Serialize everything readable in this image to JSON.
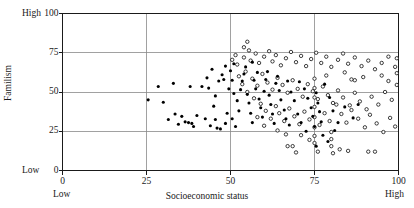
{
  "chart_data": {
    "type": "scatter",
    "title": "",
    "xlabel": "Socioeconomic status",
    "ylabel": "Familism",
    "xlim": [
      0,
      100
    ],
    "ylim": [
      0,
      100
    ],
    "xticks": [
      0,
      25,
      50,
      75,
      100
    ],
    "yticks": [
      0,
      25,
      50,
      75,
      100
    ],
    "xticklabels": [
      "0",
      "25",
      "50",
      "75",
      "100"
    ],
    "yticklabels": [
      "0",
      "25",
      "50",
      "75",
      "100"
    ],
    "grid": true,
    "grid_color": "#8a8a8a",
    "frame": true,
    "frame_color": "#1a1a1a",
    "axis_end_labels": {
      "x_low": "Low",
      "x_high": "High",
      "y_low": "Low",
      "y_high": "High"
    },
    "legend_position": "none",
    "series": [
      {
        "name": "filled",
        "marker": "filled-circle",
        "color": "#000000",
        "marker_size": 3.1,
        "points": [
          [
            25.5,
            45.0
          ],
          [
            28.5,
            53.5
          ],
          [
            33.0,
            55.5
          ],
          [
            38.0,
            53.5
          ],
          [
            41.5,
            53.5
          ],
          [
            43.5,
            52.5
          ],
          [
            45.5,
            47.5
          ],
          [
            45.0,
            41.0
          ],
          [
            46.5,
            57.0
          ],
          [
            47.5,
            61.0
          ],
          [
            48.5,
            66.5
          ],
          [
            48.0,
            58.0
          ],
          [
            49.5,
            52.0
          ],
          [
            50.0,
            63.5
          ],
          [
            50.5,
            57.5
          ],
          [
            51.0,
            49.0
          ],
          [
            33.5,
            36.0
          ],
          [
            36.5,
            31.0
          ],
          [
            37.5,
            30.5
          ],
          [
            38.5,
            30.0
          ],
          [
            40.0,
            35.0
          ],
          [
            42.5,
            33.0
          ],
          [
            44.0,
            28.5
          ],
          [
            45.5,
            32.5
          ],
          [
            46.0,
            27.0
          ],
          [
            47.0,
            26.5
          ],
          [
            48.5,
            30.0
          ],
          [
            49.0,
            36.5
          ],
          [
            50.5,
            33.0
          ],
          [
            51.5,
            28.0
          ],
          [
            52.0,
            44.5
          ],
          [
            52.5,
            38.0
          ],
          [
            53.0,
            51.5
          ],
          [
            53.5,
            57.0
          ],
          [
            54.0,
            61.5
          ],
          [
            54.5,
            66.0
          ],
          [
            55.0,
            48.5
          ],
          [
            55.5,
            43.0
          ],
          [
            56.0,
            36.5
          ],
          [
            56.5,
            30.5
          ],
          [
            57.0,
            57.5
          ],
          [
            57.5,
            52.0
          ],
          [
            58.0,
            62.5
          ],
          [
            58.5,
            45.5
          ],
          [
            59.0,
            40.0
          ],
          [
            59.5,
            34.0
          ],
          [
            60.0,
            50.5
          ],
          [
            60.5,
            58.0
          ],
          [
            61.0,
            63.0
          ],
          [
            61.5,
            48.0
          ],
          [
            62.0,
            42.0
          ],
          [
            62.5,
            36.0
          ],
          [
            63.0,
            30.0
          ],
          [
            63.5,
            55.5
          ],
          [
            64.0,
            60.0
          ],
          [
            64.5,
            51.0
          ],
          [
            65.0,
            45.0
          ],
          [
            66.0,
            38.5
          ],
          [
            66.5,
            33.0
          ],
          [
            67.0,
            57.0
          ],
          [
            68.0,
            50.0
          ],
          [
            69.0,
            44.5
          ],
          [
            70.0,
            36.0
          ],
          [
            71.0,
            30.5
          ],
          [
            72.0,
            52.0
          ],
          [
            73.0,
            46.0
          ],
          [
            74.0,
            40.0
          ],
          [
            74.5,
            34.5
          ],
          [
            75.0,
            28.0
          ],
          [
            75.5,
            49.5
          ],
          [
            76.0,
            43.0
          ],
          [
            76.5,
            37.5
          ],
          [
            77.0,
            31.0
          ],
          [
            78.0,
            55.0
          ],
          [
            79.5,
            46.5
          ],
          [
            80.5,
            38.0
          ],
          [
            82.0,
            30.5
          ],
          [
            84.0,
            40.5
          ],
          [
            86.5,
            33.5
          ],
          [
            88.0,
            42.0
          ],
          [
            30.0,
            43.5
          ],
          [
            31.5,
            32.5
          ],
          [
            34.5,
            29.5
          ],
          [
            35.5,
            34.5
          ],
          [
            39.0,
            28.0
          ],
          [
            43.0,
            59.0
          ],
          [
            44.5,
            64.5
          ],
          [
            51.0,
            68.0
          ],
          [
            56.5,
            69.0
          ],
          [
            67.5,
            29.0
          ],
          [
            70.5,
            56.5
          ],
          [
            81.0,
            25.5
          ],
          [
            77.5,
            22.5
          ],
          [
            79.0,
            18.5
          ],
          [
            75.5,
            15.5
          ],
          [
            72.5,
            25.0
          ]
        ]
      },
      {
        "name": "open",
        "marker": "open-circle",
        "color": "#000000",
        "marker_size": 3.4,
        "points": [
          [
            50.5,
            70.5
          ],
          [
            51.5,
            73.5
          ],
          [
            52.0,
            67.5
          ],
          [
            54.0,
            72.0
          ],
          [
            55.5,
            76.5
          ],
          [
            56.0,
            70.0
          ],
          [
            57.5,
            74.5
          ],
          [
            58.5,
            68.5
          ],
          [
            60.0,
            72.5
          ],
          [
            61.5,
            76.0
          ],
          [
            62.5,
            69.5
          ],
          [
            63.5,
            73.5
          ],
          [
            65.0,
            67.0
          ],
          [
            66.5,
            71.5
          ],
          [
            68.0,
            75.5
          ],
          [
            69.5,
            69.0
          ],
          [
            71.0,
            73.0
          ],
          [
            72.5,
            66.5
          ],
          [
            74.0,
            71.0
          ],
          [
            75.5,
            75.0
          ],
          [
            77.0,
            68.5
          ],
          [
            78.5,
            72.5
          ],
          [
            80.0,
            66.0
          ],
          [
            82.0,
            70.5
          ],
          [
            83.5,
            74.5
          ],
          [
            85.0,
            68.0
          ],
          [
            87.0,
            72.0
          ],
          [
            89.0,
            66.5
          ],
          [
            91.0,
            70.0
          ],
          [
            93.0,
            64.5
          ],
          [
            95.0,
            68.5
          ],
          [
            97.0,
            72.5
          ],
          [
            99.0,
            66.0
          ],
          [
            54.5,
            63.0
          ],
          [
            56.5,
            58.5
          ],
          [
            58.0,
            54.0
          ],
          [
            59.5,
            61.5
          ],
          [
            61.0,
            56.0
          ],
          [
            62.5,
            51.5
          ],
          [
            64.0,
            59.0
          ],
          [
            65.5,
            54.5
          ],
          [
            67.0,
            49.5
          ],
          [
            68.5,
            57.5
          ],
          [
            70.0,
            52.0
          ],
          [
            71.5,
            47.0
          ],
          [
            73.0,
            55.0
          ],
          [
            74.5,
            50.5
          ],
          [
            76.0,
            45.5
          ],
          [
            77.5,
            53.5
          ],
          [
            79.0,
            48.0
          ],
          [
            80.5,
            43.0
          ],
          [
            82.0,
            51.0
          ],
          [
            83.5,
            46.5
          ],
          [
            85.5,
            41.5
          ],
          [
            87.0,
            49.5
          ],
          [
            88.5,
            44.0
          ],
          [
            90.5,
            39.0
          ],
          [
            92.0,
            47.0
          ],
          [
            94.0,
            42.0
          ],
          [
            96.0,
            50.0
          ],
          [
            98.0,
            45.0
          ],
          [
            52.5,
            60.0
          ],
          [
            53.5,
            55.0
          ],
          [
            55.0,
            50.0
          ],
          [
            57.0,
            46.0
          ],
          [
            59.0,
            42.5
          ],
          [
            60.5,
            38.0
          ],
          [
            62.0,
            33.0
          ],
          [
            63.5,
            41.0
          ],
          [
            64.5,
            36.5
          ],
          [
            66.0,
            31.5
          ],
          [
            67.5,
            39.5
          ],
          [
            69.0,
            34.5
          ],
          [
            70.5,
            29.5
          ],
          [
            72.0,
            37.5
          ],
          [
            73.5,
            32.5
          ],
          [
            75.0,
            27.5
          ],
          [
            75.0,
            34.0
          ],
          [
            75.0,
            40.5
          ],
          [
            75.0,
            46.5
          ],
          [
            75.0,
            52.5
          ],
          [
            75.0,
            58.5
          ],
          [
            75.0,
            22.0
          ],
          [
            75.0,
            17.5
          ],
          [
            76.5,
            29.0
          ],
          [
            78.0,
            36.5
          ],
          [
            79.5,
            31.5
          ],
          [
            80.0,
            24.5
          ],
          [
            80.0,
            20.0
          ],
          [
            80.0,
            15.5
          ],
          [
            81.5,
            42.0
          ],
          [
            83.0,
            36.0
          ],
          [
            84.5,
            30.5
          ],
          [
            86.0,
            38.5
          ],
          [
            88.0,
            33.0
          ],
          [
            90.0,
            27.5
          ],
          [
            91.5,
            35.5
          ],
          [
            93.5,
            30.0
          ],
          [
            95.5,
            24.5
          ],
          [
            97.5,
            33.5
          ],
          [
            99.0,
            28.0
          ],
          [
            82.5,
            13.5
          ],
          [
            85.0,
            12.5
          ],
          [
            91.0,
            12.0
          ],
          [
            93.0,
            12.0
          ],
          [
            67.0,
            15.5
          ],
          [
            68.5,
            15.5
          ],
          [
            69.5,
            11.5
          ],
          [
            76.0,
            12.0
          ],
          [
            80.5,
            11.0
          ],
          [
            54.0,
            78.5
          ],
          [
            55.0,
            82.0
          ],
          [
            86.0,
            58.0
          ],
          [
            87.0,
            57.5
          ],
          [
            99.5,
            71.5
          ],
          [
            99.5,
            62.0
          ],
          [
            99.5,
            54.5
          ],
          [
            58.0,
            34.0
          ],
          [
            60.0,
            28.5
          ],
          [
            64.0,
            25.5
          ],
          [
            66.5,
            23.0
          ],
          [
            71.0,
            22.5
          ],
          [
            73.5,
            19.5
          ],
          [
            78.5,
            60.5
          ],
          [
            84.0,
            62.5
          ],
          [
            89.5,
            59.5
          ],
          [
            95.0,
            60.5
          ],
          [
            97.0,
            57.0
          ]
        ]
      }
    ]
  },
  "axes": {
    "y_high_label": "High",
    "y_low_label": "Low",
    "x_low_label": "Low",
    "x_high_label": "High"
  }
}
